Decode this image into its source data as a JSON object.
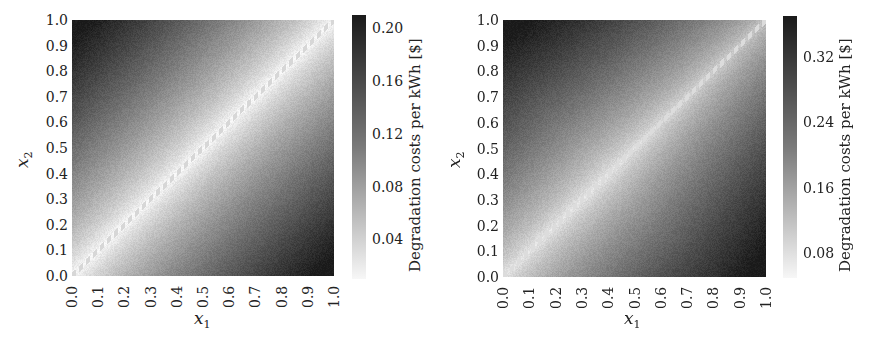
{
  "chart_data": [
    {
      "type": "heatmap",
      "title": "",
      "xlabel": "x1",
      "ylabel": "x2",
      "x_ticks": [
        "0.0",
        "0.1",
        "0.2",
        "0.3",
        "0.4",
        "0.5",
        "0.6",
        "0.7",
        "0.8",
        "0.9",
        "1.0"
      ],
      "y_ticks": [
        "0.0",
        "0.1",
        "0.2",
        "0.3",
        "0.4",
        "0.5",
        "0.6",
        "0.7",
        "0.8",
        "0.9",
        "1.0"
      ],
      "xlim": [
        0,
        1
      ],
      "ylim": [
        0,
        1
      ],
      "colorbar": {
        "label": "Degradation costs per kWh [$]",
        "ticks": [
          "0.04",
          "0.08",
          "0.12",
          "0.16",
          "0.20"
        ],
        "range": [
          0.01,
          0.21
        ],
        "colormap": "greys"
      },
      "description": "Cost minimal along diagonal x1=x2 (light), increasing with |x1-x2|, maximum at corners (0,1) and (1,0)",
      "values_at_points": [
        {
          "x1": 0.0,
          "x2": 1.0,
          "cost": 0.21
        },
        {
          "x1": 1.0,
          "x2": 0.0,
          "cost": 0.21
        },
        {
          "x1": 0.5,
          "x2": 0.5,
          "cost": 0.01
        },
        {
          "x1": 0.0,
          "x2": 0.5,
          "cost": 0.09
        },
        {
          "x1": 0.5,
          "x2": 0.0,
          "cost": 0.09
        }
      ],
      "grid": false
    },
    {
      "type": "heatmap",
      "title": "",
      "xlabel": "x1",
      "ylabel": "x2",
      "x_ticks": [
        "0.0",
        "0.1",
        "0.2",
        "0.3",
        "0.4",
        "0.5",
        "0.6",
        "0.7",
        "0.8",
        "0.9",
        "1.0"
      ],
      "y_ticks": [
        "0.0",
        "0.1",
        "0.2",
        "0.3",
        "0.4",
        "0.5",
        "0.6",
        "0.7",
        "0.8",
        "0.9",
        "1.0"
      ],
      "xlim": [
        0,
        1
      ],
      "ylim": [
        0,
        1
      ],
      "colorbar": {
        "label": "Degradation costs per kWh [$]",
        "ticks": [
          "0.08",
          "0.16",
          "0.24",
          "0.32"
        ],
        "range": [
          0.05,
          0.37
        ],
        "colormap": "greys"
      },
      "description": "Cost minimal along diagonal x1=x2 (light), increasing with |x1-x2|, maximum at corners (0,1) and (1,0); diagonal darker toward (1,1)",
      "values_at_points": [
        {
          "x1": 0.0,
          "x2": 1.0,
          "cost": 0.37
        },
        {
          "x1": 1.0,
          "x2": 0.0,
          "cost": 0.37
        },
        {
          "x1": 0.3,
          "x2": 0.3,
          "cost": 0.06
        },
        {
          "x1": 0.9,
          "x2": 0.9,
          "cost": 0.16
        }
      ],
      "grid": false
    }
  ],
  "left": {
    "ylabel_var": "x",
    "ylabel_sub": "2",
    "xlabel_var": "x",
    "xlabel_sub": "1",
    "cb_label": "Degradation costs per kWh [$]"
  },
  "right": {
    "ylabel_var": "x",
    "ylabel_sub": "2",
    "xlabel_var": "x",
    "xlabel_sub": "1",
    "cb_label": "Degradation costs per kWh [$]"
  }
}
